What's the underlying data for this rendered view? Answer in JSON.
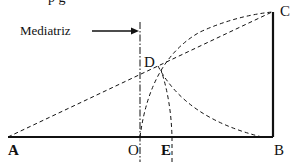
{
  "diagram": {
    "annotation": "Mediatriz",
    "top_text_fragment": "p    g",
    "points": {
      "A": "A",
      "B": "B",
      "C": "C",
      "D": "D",
      "O": "O",
      "E": "E"
    },
    "colors": {
      "stroke": "#111111",
      "background": "#ffffff"
    }
  }
}
